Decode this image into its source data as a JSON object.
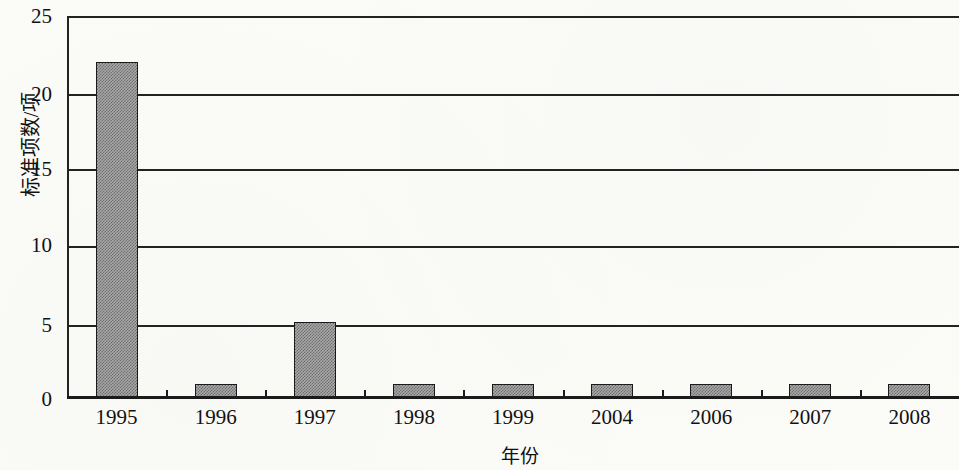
{
  "chart_data": {
    "type": "bar",
    "title": "",
    "subtitle": "",
    "xlabel": "年份",
    "ylabel": "标准项数/项",
    "categories": [
      "1995",
      "1996",
      "1997",
      "1998",
      "1999",
      "2004",
      "2006",
      "2007",
      "2008"
    ],
    "values": [
      22,
      1,
      5,
      1,
      1,
      1,
      1,
      1,
      1
    ],
    "series": [
      {
        "name": "标准项数",
        "values": [
          22,
          1,
          5,
          1,
          1,
          1,
          1,
          1,
          1
        ]
      }
    ],
    "ylim": [
      0,
      25
    ],
    "yticks": [
      0,
      5,
      10,
      15,
      20,
      25
    ],
    "ytick_labels": [
      "0",
      "5",
      "10",
      "15",
      "20",
      "25"
    ],
    "xlim_categories": 9,
    "grid": "horizontal",
    "legend": "none",
    "bar_fill": "#a9a9a9",
    "bar_pattern": "checkered-dither",
    "bar_edge_color": "#1a1a1a",
    "axis_color": "#1b1b1b",
    "background": "#fbfbf8"
  },
  "axes": {
    "y_title": "标准项数/项",
    "x_title": "年份"
  }
}
